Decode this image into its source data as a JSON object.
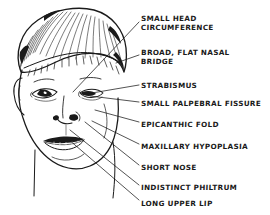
{
  "figure": {
    "style": "hand-drawn ink line illustration with hand-lettered labels",
    "background_color": "#ffffff",
    "ink_color": "#1a1a1a",
    "width": 270,
    "height": 215
  },
  "labels": [
    {
      "id": "small-head-circumference",
      "text": "SMALL HEAD\nCIRCUMFERENCE",
      "x": 141,
      "y": 14,
      "leader": {
        "x1": 139,
        "y1": 22,
        "x2": 73,
        "y2": 92
      }
    },
    {
      "id": "broad-flat-nasal-bridge",
      "text": "BROAD, FLAT NASAL\nBRIDGE",
      "x": 141,
      "y": 48,
      "leader": {
        "x1": 139,
        "y1": 55,
        "x2": 116,
        "y2": 63
      }
    },
    {
      "id": "strabismus",
      "text": "STRABISMUS",
      "x": 141,
      "y": 81,
      "leader": {
        "x1": 139,
        "y1": 85,
        "x2": 86,
        "y2": 94
      }
    },
    {
      "id": "small-palpebral-fissure",
      "text": "SMALL PALPEBRAL FISSURE",
      "x": 141,
      "y": 99,
      "leader": {
        "x1": 139,
        "y1": 102,
        "x2": 90,
        "y2": 96
      }
    },
    {
      "id": "epicanthic-fold",
      "text": "EPICANTHIC FOLD",
      "x": 141,
      "y": 120,
      "leader": {
        "x1": 139,
        "y1": 122,
        "x2": 95,
        "y2": 110
      }
    },
    {
      "id": "maxillary-hypoplasia",
      "text": "MAXILLARY HYPOPLASIA",
      "x": 141,
      "y": 142,
      "leader": {
        "x1": 139,
        "y1": 144,
        "x2": 92,
        "y2": 121
      }
    },
    {
      "id": "short-nose",
      "text": "SHORT NOSE",
      "x": 141,
      "y": 163,
      "leader": {
        "x1": 139,
        "y1": 165,
        "x2": 85,
        "y2": 122
      }
    },
    {
      "id": "indistinct-philtrum",
      "text": "INDISTINCT PHILTRUM",
      "x": 141,
      "y": 183,
      "leader": {
        "x1": 139,
        "y1": 185,
        "x2": 70,
        "y2": 130
      }
    },
    {
      "id": "long-upper-lip",
      "text": "LONG UPPER LIP",
      "x": 141,
      "y": 199,
      "leader": {
        "x1": 139,
        "y1": 200,
        "x2": 68,
        "y2": 139
      }
    }
  ]
}
